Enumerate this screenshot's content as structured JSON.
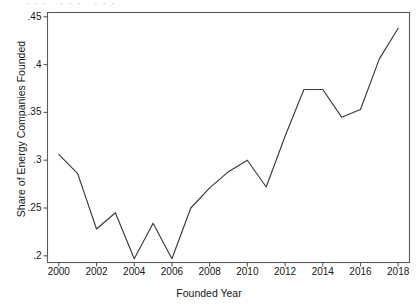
{
  "chart_data": {
    "type": "line",
    "title": "",
    "xlabel": "Founded Year",
    "ylabel": "Share of Energy Companies Founded",
    "x": [
      2000,
      2001,
      2002,
      2003,
      2004,
      2005,
      2006,
      2007,
      2008,
      2009,
      2010,
      2011,
      2012,
      2013,
      2014,
      2015,
      2016,
      2017,
      2018
    ],
    "values": [
      0.306,
      0.286,
      0.228,
      0.245,
      0.197,
      0.234,
      0.197,
      0.25,
      0.271,
      0.288,
      0.3,
      0.272,
      0.325,
      0.374,
      0.374,
      0.345,
      0.353,
      0.406,
      0.438
    ],
    "xlim": [
      1999.4,
      2018.6
    ],
    "ylim": [
      0.193,
      0.4545
    ],
    "xticks": [
      2000,
      2002,
      2004,
      2006,
      2008,
      2010,
      2012,
      2014,
      2016,
      2018
    ],
    "xtick_labels": [
      "2000",
      "2002",
      "2004",
      "2006",
      "2008",
      "2010",
      "2012",
      "2014",
      "2016",
      "2018"
    ],
    "yticks": [
      0.2,
      0.25,
      0.3,
      0.35,
      0.4,
      0.45
    ],
    "ytick_labels": [
      ".2",
      ".25",
      ".3",
      ".35",
      ".4",
      ".45"
    ],
    "grid": false,
    "legend": null,
    "line_color": "#3a3a3a",
    "axis_color": "#5a5a5a",
    "background": "#ffffff"
  },
  "artifact": {
    "top_clipped_text": "···   ···   ···"
  }
}
